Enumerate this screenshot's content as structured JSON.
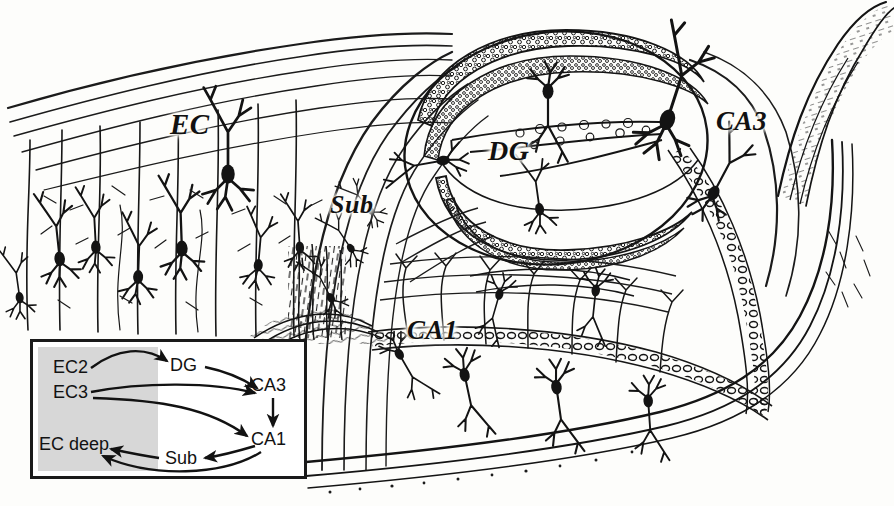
{
  "figure": {
    "type": "histology-drawing",
    "background_color": "#fdfdfb",
    "ink_color": "#111111"
  },
  "region_labels": [
    {
      "id": "ec",
      "text": "EC",
      "x": 170,
      "y": 108
    },
    {
      "id": "sub",
      "text": "Sub",
      "x": 330,
      "y": 190
    },
    {
      "id": "dg",
      "text": "DG",
      "x": 488,
      "y": 135
    },
    {
      "id": "ca3",
      "text": "CA3",
      "x": 716,
      "y": 106
    },
    {
      "id": "ca1",
      "text": "CA1",
      "x": 407,
      "y": 315
    }
  ],
  "inset": {
    "title": "hippocampal circuit diagram",
    "border_color": "#1a1a1a",
    "panel_color": "#ffffff",
    "shaded_color": "#d7d7d7",
    "nodes": [
      {
        "id": "ec2",
        "label": "EC2"
      },
      {
        "id": "ec3",
        "label": "EC3"
      },
      {
        "id": "ecdeep",
        "label": "EC deep"
      },
      {
        "id": "dg",
        "label": "DG"
      },
      {
        "id": "ca3",
        "label": "CA3"
      },
      {
        "id": "ca1",
        "label": "CA1"
      },
      {
        "id": "sub",
        "label": "Sub"
      }
    ],
    "connections": [
      {
        "from": "EC2",
        "to": "DG",
        "style": "curved-arrow"
      },
      {
        "from": "DG",
        "to": "CA3",
        "style": "curved-arrow"
      },
      {
        "from": "EC3",
        "to": "CA3",
        "style": "curved-arrow"
      },
      {
        "from": "CA3",
        "to": "CA1",
        "style": "straight-arrow"
      },
      {
        "from": "EC3",
        "to": "CA1",
        "style": "curved-arrow"
      },
      {
        "from": "CA1",
        "to": "Sub",
        "style": "curved-arrow"
      },
      {
        "from": "Sub",
        "to": "EC deep",
        "style": "straight-arrow"
      },
      {
        "from": "CA1",
        "to": "EC deep",
        "style": "curved-arrow"
      }
    ]
  }
}
